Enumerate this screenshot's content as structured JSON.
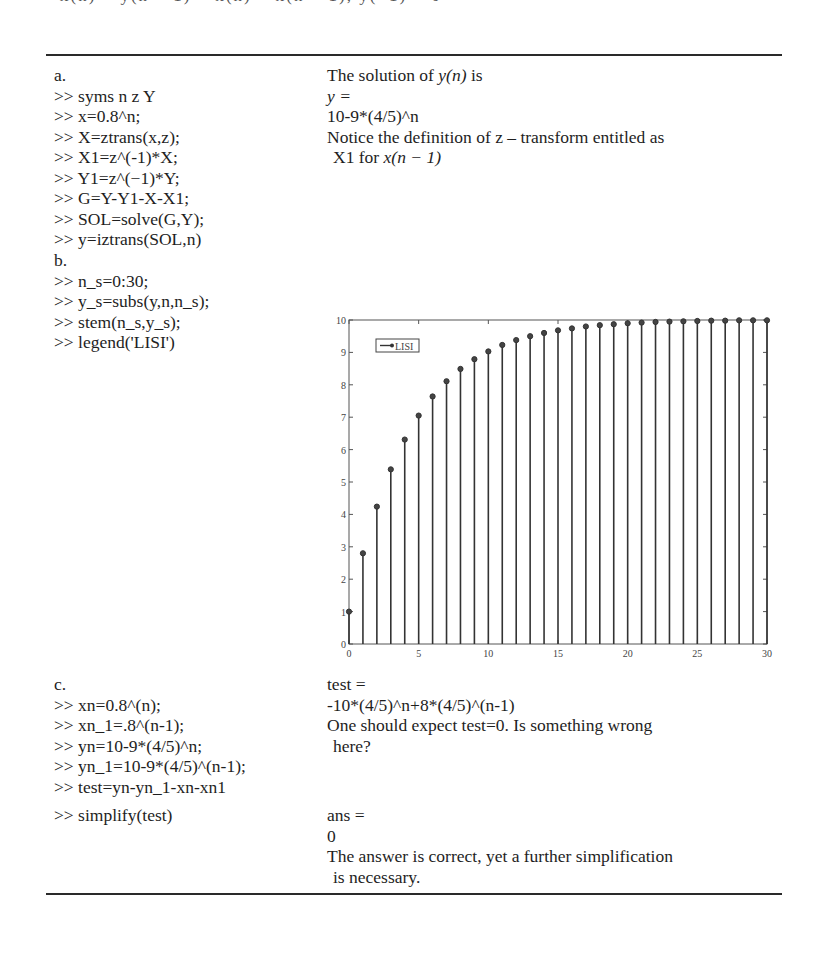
{
  "page": {
    "cropped_top_text": "x(n) − y(n − 1) = x(n) + x(n − 1), y(−1) = 0"
  },
  "section_a": {
    "label": "a.",
    "code": [
      ">> syms n z Y",
      ">> x=0.8^n;",
      ">> X=ztrans(x,z);",
      ">> X1=z^(-1)*X;",
      ">> Y1=z^(−1)*Y;",
      ">> G=Y-Y1-X-X1;",
      ">> SOL=solve(G,Y);",
      ">> y=iztrans(SOL,n)"
    ],
    "output": {
      "intro_prefix": "The solution of ",
      "intro_math": "y(n)",
      "intro_suffix": " is",
      "var_line": "y =",
      "result": "10-9*(4/5)^n",
      "note_line1": "Notice the definition of z – transform entitled as",
      "note_line2_prefix": "X1 for ",
      "note_line2_math": "x(n − 1)"
    }
  },
  "section_b": {
    "label": "b.",
    "code": [
      ">> n_s=0:30;",
      ">> y_s=subs(y,n,n_s);",
      ">> stem(n_s,y_s);",
      ">> legend('LISI')"
    ]
  },
  "section_c": {
    "label": "c.",
    "code": [
      ">> xn=0.8^(n);",
      ">> xn_1=.8^(n-1);",
      ">> yn=10-9*(4/5)^n;",
      ">> yn_1=10-9*(4/5)^(n-1);",
      ">> test=yn-yn_1-xn-xn1",
      ">> simplify(test)"
    ],
    "output": {
      "test_var": "test =",
      "test_result": "-10*(4/5)^n+8*(4/5)^(n-1)",
      "comment_line1": "One should expect test=0. Is something wrong",
      "comment_line2": "here?",
      "ans_var": "ans =",
      "ans_value": "0",
      "final_line1": "The answer is correct, yet a further simplification",
      "final_line2": "is necessary."
    }
  },
  "chart_data": {
    "type": "stem",
    "title": "",
    "xlabel": "",
    "ylabel": "",
    "x": [
      0,
      1,
      2,
      3,
      4,
      5,
      6,
      7,
      8,
      9,
      10,
      11,
      12,
      13,
      14,
      15,
      16,
      17,
      18,
      19,
      20,
      21,
      22,
      23,
      24,
      25,
      26,
      27,
      28,
      29,
      30
    ],
    "series": [
      {
        "name": "LISI",
        "values": [
          1.0,
          2.8,
          4.24,
          5.39,
          6.31,
          7.05,
          7.64,
          8.11,
          8.49,
          8.79,
          9.03,
          9.23,
          9.38,
          9.5,
          9.6,
          9.68,
          9.74,
          9.8,
          9.84,
          9.87,
          9.9,
          9.92,
          9.94,
          9.95,
          9.96,
          9.97,
          9.98,
          9.98,
          9.99,
          9.99,
          9.99
        ]
      }
    ],
    "xlim": [
      0,
      30
    ],
    "ylim": [
      0,
      10
    ],
    "xticks": [
      "0",
      "5",
      "10",
      "15",
      "20",
      "25",
      "30"
    ],
    "yticks": [
      "0",
      "1",
      "2",
      "3",
      "4",
      "5",
      "6",
      "7",
      "8",
      "9",
      "10"
    ],
    "legend": {
      "entries": [
        "LISI"
      ],
      "position": "upper-left"
    },
    "grid": false
  }
}
